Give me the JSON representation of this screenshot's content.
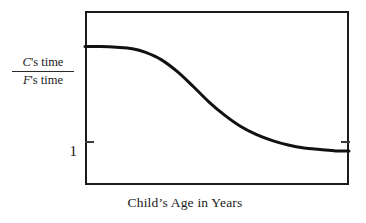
{
  "figure": {
    "background_color": "#ffffff",
    "ink_color": "#1b1b1b",
    "curve_color": "#111111"
  },
  "y_axis": {
    "label_numerator_prefix": "C",
    "label_numerator_rest": "'s time",
    "label_denominator_prefix": "F",
    "label_denominator_rest": "'s time",
    "label_numerator_full": "C's time",
    "label_denominator_full": "F's time",
    "tick_labels": [
      "1"
    ],
    "tick_one": "1"
  },
  "x_axis": {
    "caption": "Child’s Age in Years",
    "tick_labels": []
  },
  "chart_data": {
    "type": "line",
    "title": "",
    "subtitle": "",
    "xlabel": "Child’s Age in Years",
    "ylabel": "C's time / F's time",
    "grid": false,
    "legend": false,
    "legend_position": "none",
    "xlim": [
      0,
      10
    ],
    "ylim": [
      0.85,
      3.2
    ],
    "yticks": [
      1
    ],
    "ytick_labels": [
      "1"
    ],
    "xticks": [],
    "xtick_labels": [],
    "annotations": [
      {
        "text": "curve is a decreasing sigmoid (ogive): high plateau in early years, steep decline in middle years, flattening toward a low asymptote slightly above 1"
      }
    ],
    "series": [
      {
        "name": "C's time / F's time",
        "line_width": 3,
        "color": "#111111",
        "x": [
          0.0,
          0.6,
          1.2,
          1.8,
          2.3,
          2.9,
          3.5,
          4.1,
          4.7,
          5.3,
          5.9,
          6.5,
          7.1,
          7.7,
          8.3,
          8.9,
          9.5,
          10.0
        ],
        "y": [
          2.72,
          2.72,
          2.71,
          2.69,
          2.64,
          2.54,
          2.38,
          2.18,
          1.97,
          1.79,
          1.64,
          1.53,
          1.45,
          1.39,
          1.35,
          1.33,
          1.31,
          1.31
        ]
      }
    ]
  }
}
